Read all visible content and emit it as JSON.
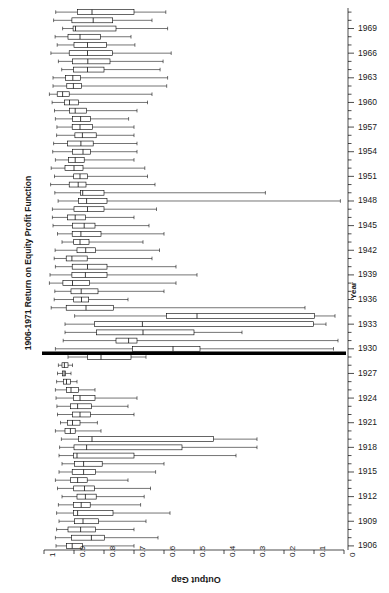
{
  "chart_data": {
    "type": "box",
    "title": "1906-1971 Return on Equity Profit Function",
    "xlabel": "Output Gap",
    "ylabel": "Year",
    "xlim": [
      1.0,
      0.0
    ],
    "x_reversed": true,
    "xticks": [
      "1",
      "0.9",
      "0.8",
      "0.7",
      "0.6",
      "0.5",
      "0.4",
      "0.3",
      "0.2",
      "0.1",
      "0"
    ],
    "xtick_values": [
      1.0,
      0.9,
      0.8,
      0.7,
      0.6,
      0.5,
      0.4,
      0.3,
      0.2,
      0.1,
      0.0
    ],
    "yticks": [
      "1969",
      "1966",
      "1963",
      "1960",
      "1957",
      "1954",
      "1951",
      "1948",
      "1945",
      "1942",
      "1939",
      "1936",
      "1933",
      "1930",
      "1927",
      "1924",
      "1921",
      "1918",
      "1915",
      "1912",
      "1909",
      "1906"
    ],
    "ytick_values": [
      1969,
      1966,
      1963,
      1960,
      1957,
      1954,
      1951,
      1948,
      1945,
      1942,
      1939,
      1936,
      1933,
      1930,
      1927,
      1924,
      1921,
      1918,
      1915,
      1912,
      1909,
      1906
    ],
    "grid": false,
    "legend": false,
    "highlight_row": {
      "year": 1930,
      "style": "thick-black-rule"
    },
    "box_orientation": "horizontal",
    "series_name": "Output Gap distribution by year",
    "boxes": [
      {
        "year": 1971,
        "whisker_low": 0.961,
        "q1": 0.889,
        "median": 0.84,
        "q3": 0.7,
        "whisker_high": 0.594
      },
      {
        "year": 1970,
        "whisker_low": 0.968,
        "q1": 0.907,
        "median": 0.836,
        "q3": 0.771,
        "whisker_high": 0.64
      },
      {
        "year": 1969,
        "whisker_low": 0.938,
        "q1": 0.903,
        "median": 0.895,
        "q3": 0.76,
        "whisker_high": 0.588
      },
      {
        "year": 1968,
        "whisker_low": 0.963,
        "q1": 0.92,
        "median": 0.88,
        "q3": 0.812,
        "whisker_high": 0.71
      },
      {
        "year": 1967,
        "whisker_low": 0.956,
        "q1": 0.9,
        "median": 0.855,
        "q3": 0.792,
        "whisker_high": 0.697
      },
      {
        "year": 1966,
        "whisker_low": 0.977,
        "q1": 0.916,
        "median": 0.855,
        "q3": 0.772,
        "whisker_high": 0.576
      },
      {
        "year": 1965,
        "whisker_low": 0.952,
        "q1": 0.905,
        "median": 0.854,
        "q3": 0.78,
        "whisker_high": 0.603
      },
      {
        "year": 1964,
        "whisker_low": 0.941,
        "q1": 0.902,
        "median": 0.855,
        "q3": 0.8,
        "whisker_high": 0.613
      },
      {
        "year": 1963,
        "whisker_low": 0.97,
        "q1": 0.928,
        "median": 0.904,
        "q3": 0.878,
        "whisker_high": 0.588
      },
      {
        "year": 1962,
        "whisker_low": 0.97,
        "q1": 0.924,
        "median": 0.902,
        "q3": 0.875,
        "whisker_high": 0.591
      },
      {
        "year": 1961,
        "whisker_low": 0.982,
        "q1": 0.956,
        "median": 0.938,
        "q3": 0.916,
        "whisker_high": 0.64
      },
      {
        "year": 1960,
        "whisker_low": 0.973,
        "q1": 0.932,
        "median": 0.915,
        "q3": 0.885,
        "whisker_high": 0.655
      },
      {
        "year": 1959,
        "whisker_low": 0.965,
        "q1": 0.915,
        "median": 0.896,
        "q3": 0.858,
        "whisker_high": 0.69
      },
      {
        "year": 1958,
        "whisker_low": 0.962,
        "q1": 0.905,
        "median": 0.878,
        "q3": 0.845,
        "whisker_high": 0.718
      },
      {
        "year": 1957,
        "whisker_low": 0.957,
        "q1": 0.906,
        "median": 0.88,
        "q3": 0.838,
        "whisker_high": 0.7
      },
      {
        "year": 1956,
        "whisker_low": 0.958,
        "q1": 0.897,
        "median": 0.872,
        "q3": 0.826,
        "whisker_high": 0.7
      },
      {
        "year": 1955,
        "whisker_low": 0.968,
        "q1": 0.922,
        "median": 0.877,
        "q3": 0.836,
        "whisker_high": 0.69
      },
      {
        "year": 1954,
        "whisker_low": 0.971,
        "q1": 0.905,
        "median": 0.87,
        "q3": 0.845,
        "whisker_high": 0.69
      },
      {
        "year": 1953,
        "whisker_low": 0.962,
        "q1": 0.918,
        "median": 0.896,
        "q3": 0.866,
        "whisker_high": 0.7
      },
      {
        "year": 1952,
        "whisker_low": 0.976,
        "q1": 0.93,
        "median": 0.9,
        "q3": 0.87,
        "whisker_high": 0.664
      },
      {
        "year": 1951,
        "whisker_low": 0.965,
        "q1": 0.901,
        "median": 0.88,
        "q3": 0.855,
        "whisker_high": 0.655
      },
      {
        "year": 1950,
        "whisker_low": 0.978,
        "q1": 0.916,
        "median": 0.886,
        "q3": 0.86,
        "whisker_high": 0.63
      },
      {
        "year": 1949,
        "whisker_low": 0.964,
        "q1": 0.878,
        "median": 0.871,
        "q3": 0.8,
        "whisker_high": 0.262
      },
      {
        "year": 1948,
        "whisker_low": 0.953,
        "q1": 0.885,
        "median": 0.858,
        "q3": 0.79,
        "whisker_high": 0.012
      },
      {
        "year": 1947,
        "whisker_low": 0.972,
        "q1": 0.9,
        "median": 0.855,
        "q3": 0.8,
        "whisker_high": 0.625
      },
      {
        "year": 1946,
        "whisker_low": 0.972,
        "q1": 0.922,
        "median": 0.896,
        "q3": 0.862,
        "whisker_high": 0.7
      },
      {
        "year": 1945,
        "whisker_low": 0.97,
        "q1": 0.905,
        "median": 0.866,
        "q3": 0.83,
        "whisker_high": 0.65
      },
      {
        "year": 1944,
        "whisker_low": 0.955,
        "q1": 0.906,
        "median": 0.877,
        "q3": 0.81,
        "whisker_high": 0.6
      },
      {
        "year": 1943,
        "whisker_low": 0.94,
        "q1": 0.901,
        "median": 0.88,
        "q3": 0.85,
        "whisker_high": 0.67
      },
      {
        "year": 1942,
        "whisker_low": 0.963,
        "q1": 0.89,
        "median": 0.861,
        "q3": 0.828,
        "whisker_high": 0.615
      },
      {
        "year": 1941,
        "whisker_low": 0.966,
        "q1": 0.926,
        "median": 0.907,
        "q3": 0.856,
        "whisker_high": 0.64
      },
      {
        "year": 1940,
        "whisker_low": 0.962,
        "q1": 0.906,
        "median": 0.855,
        "q3": 0.79,
        "whisker_high": 0.56
      },
      {
        "year": 1939,
        "whisker_low": 0.98,
        "q1": 0.907,
        "median": 0.862,
        "q3": 0.79,
        "whisker_high": 0.49
      },
      {
        "year": 1938,
        "whisker_low": 0.982,
        "q1": 0.937,
        "median": 0.905,
        "q3": 0.848,
        "whisker_high": 0.56
      },
      {
        "year": 1937,
        "whisker_low": 0.964,
        "q1": 0.91,
        "median": 0.876,
        "q3": 0.82,
        "whisker_high": 0.6
      },
      {
        "year": 1936,
        "whisker_low": 0.966,
        "q1": 0.901,
        "median": 0.875,
        "q3": 0.851,
        "whisker_high": 0.72
      },
      {
        "year": 1935,
        "whisker_low": 0.976,
        "q1": 0.926,
        "median": 0.86,
        "q3": 0.768,
        "whisker_high": 0.13
      },
      {
        "year": 1934,
        "whisker_low": 0.898,
        "q1": 0.592,
        "median": 0.49,
        "q3": 0.098,
        "whisker_high": 0.03
      },
      {
        "year": 1933,
        "whisker_low": 0.93,
        "q1": 0.832,
        "median": 0.672,
        "q3": 0.102,
        "whisker_high": 0.06
      },
      {
        "year": 1932,
        "whisker_low": 0.93,
        "q1": 0.825,
        "median": 0.67,
        "q3": 0.5,
        "whisker_high": 0.34
      },
      {
        "year": 1931,
        "whisker_low": 0.936,
        "q1": 0.76,
        "median": 0.718,
        "q3": 0.69,
        "whisker_high": 0.02
      },
      {
        "year": 1930,
        "whisker_low": 0.962,
        "q1": 0.705,
        "median": 0.57,
        "q3": 0.48,
        "whisker_high": 0.035
      },
      {
        "year": 1929,
        "whisker_low": 0.92,
        "q1": 0.855,
        "median": 0.81,
        "q3": 0.71,
        "whisker_high": 0.66
      },
      {
        "year": 1928,
        "whisker_low": 0.952,
        "q1": 0.94,
        "median": 0.932,
        "q3": 0.92,
        "whisker_high": 0.905
      },
      {
        "year": 1927,
        "whisker_low": 0.955,
        "q1": 0.938,
        "median": 0.933,
        "q3": 0.928,
        "whisker_high": 0.91
      },
      {
        "year": 1926,
        "whisker_low": 0.958,
        "q1": 0.935,
        "median": 0.925,
        "q3": 0.912,
        "whisker_high": 0.89
      },
      {
        "year": 1925,
        "whisker_low": 0.962,
        "q1": 0.925,
        "median": 0.91,
        "q3": 0.885,
        "whisker_high": 0.83
      },
      {
        "year": 1924,
        "whisker_low": 0.96,
        "q1": 0.902,
        "median": 0.88,
        "q3": 0.83,
        "whisker_high": 0.69
      },
      {
        "year": 1923,
        "whisker_low": 0.957,
        "q1": 0.912,
        "median": 0.888,
        "q3": 0.842,
        "whisker_high": 0.72
      },
      {
        "year": 1922,
        "whisker_low": 0.955,
        "q1": 0.905,
        "median": 0.88,
        "q3": 0.845,
        "whisker_high": 0.7
      },
      {
        "year": 1921,
        "whisker_low": 0.945,
        "q1": 0.922,
        "median": 0.905,
        "q3": 0.88,
        "whisker_high": 0.822
      },
      {
        "year": 1920,
        "whisker_low": 0.962,
        "q1": 0.93,
        "median": 0.912,
        "q3": 0.896,
        "whisker_high": 0.81
      },
      {
        "year": 1919,
        "whisker_low": 0.942,
        "q1": 0.885,
        "median": 0.84,
        "q3": 0.435,
        "whisker_high": 0.29
      },
      {
        "year": 1918,
        "whisker_low": 0.948,
        "q1": 0.9,
        "median": 0.858,
        "q3": 0.54,
        "whisker_high": 0.29
      },
      {
        "year": 1917,
        "whisker_low": 0.95,
        "q1": 0.902,
        "median": 0.89,
        "q3": 0.7,
        "whisker_high": 0.36
      },
      {
        "year": 1916,
        "whisker_low": 0.94,
        "q1": 0.898,
        "median": 0.868,
        "q3": 0.806,
        "whisker_high": 0.6
      },
      {
        "year": 1915,
        "whisker_low": 0.95,
        "q1": 0.906,
        "median": 0.868,
        "q3": 0.828,
        "whisker_high": 0.628
      },
      {
        "year": 1914,
        "whisker_low": 0.962,
        "q1": 0.912,
        "median": 0.888,
        "q3": 0.856,
        "whisker_high": 0.72
      },
      {
        "year": 1913,
        "whisker_low": 0.955,
        "q1": 0.901,
        "median": 0.865,
        "q3": 0.832,
        "whisker_high": 0.645
      },
      {
        "year": 1912,
        "whisker_low": 0.94,
        "q1": 0.89,
        "median": 0.862,
        "q3": 0.826,
        "whisker_high": 0.666
      },
      {
        "year": 1911,
        "whisker_low": 0.952,
        "q1": 0.902,
        "median": 0.876,
        "q3": 0.846,
        "whisker_high": 0.678
      },
      {
        "year": 1910,
        "whisker_low": 0.958,
        "q1": 0.902,
        "median": 0.888,
        "q3": 0.77,
        "whisker_high": 0.58
      },
      {
        "year": 1909,
        "whisker_low": 0.95,
        "q1": 0.898,
        "median": 0.87,
        "q3": 0.818,
        "whisker_high": 0.66
      },
      {
        "year": 1908,
        "whisker_low": 0.958,
        "q1": 0.92,
        "median": 0.878,
        "q3": 0.828,
        "whisker_high": 0.7
      },
      {
        "year": 1907,
        "whisker_low": 0.962,
        "q1": 0.908,
        "median": 0.842,
        "q3": 0.798,
        "whisker_high": 0.62
      },
      {
        "year": 1906,
        "whisker_low": 0.96,
        "q1": 0.925,
        "median": 0.906,
        "q3": 0.872,
        "whisker_high": 0.7
      }
    ]
  },
  "axes": {
    "x_label": "Output Gap",
    "y_label": "Year",
    "title": "1906-1971 Return on Equity Profit Function"
  },
  "style": {
    "box_stroke": "#000000",
    "whisker_stroke": "#000000",
    "axis_stroke": "#000000",
    "background": "#ffffff",
    "highlight_color": "#000000"
  }
}
